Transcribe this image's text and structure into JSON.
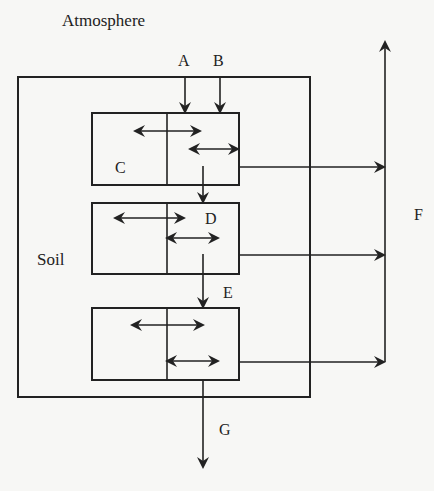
{
  "diagram": {
    "labels": {
      "atmosphere": "Atmosphere",
      "soil": "Soil",
      "A": "A",
      "B": "B",
      "C": "C",
      "D": "D",
      "E": "E",
      "F": "F",
      "G": "G"
    },
    "colors": {
      "line": "#222222",
      "background": "#f7f7f5"
    },
    "compartments": [
      {
        "id": "layer-1",
        "label": "C"
      },
      {
        "id": "layer-2",
        "label": "D"
      },
      {
        "id": "layer-3",
        "label": ""
      }
    ]
  }
}
